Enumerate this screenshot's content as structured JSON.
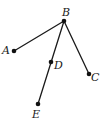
{
  "diagram": {
    "type": "tree-graph",
    "colors": {
      "line": "#1a1a1a",
      "node": "#111111",
      "background": "#ffffff"
    },
    "nodes": [
      {
        "id": "B",
        "label": "B",
        "x": 64,
        "y": 21,
        "label_x": 62,
        "label_y": 16
      },
      {
        "id": "A",
        "label": "A",
        "x": 14,
        "y": 51,
        "label_x": 2,
        "label_y": 54
      },
      {
        "id": "D",
        "label": "D",
        "x": 51,
        "y": 62,
        "label_x": 54,
        "label_y": 69
      },
      {
        "id": "C",
        "label": "C",
        "x": 89,
        "y": 74,
        "label_x": 91,
        "label_y": 81
      },
      {
        "id": "E",
        "label": "E",
        "x": 38,
        "y": 104,
        "label_x": 32,
        "label_y": 118
      }
    ],
    "edges": [
      {
        "from": "B",
        "to": "A"
      },
      {
        "from": "B",
        "to": "E",
        "through": "D"
      },
      {
        "from": "B",
        "to": "C"
      }
    ]
  }
}
